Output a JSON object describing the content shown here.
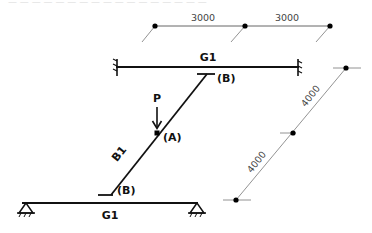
{
  "header": {
    "cropped_text": "— — — — — — — — — — — — — — — — —"
  },
  "dimensions": {
    "horizontal": [
      {
        "label": "3000"
      },
      {
        "label": "3000"
      }
    ],
    "diagonal": [
      {
        "label": "4000"
      },
      {
        "label": "4000"
      }
    ]
  },
  "members": {
    "top_girder": {
      "label": "G1",
      "support": "fixed-both-ends"
    },
    "bottom_girder": {
      "label": "G1",
      "support": "pinned-both-ends"
    },
    "diagonal_beam": {
      "label": "B1"
    }
  },
  "points": {
    "top_connection": {
      "label": "(B)"
    },
    "bottom_connection": {
      "label": "(B)"
    },
    "load_point": {
      "label": "(A)"
    }
  },
  "load": {
    "label": "P"
  },
  "colors": {
    "member": "#111111",
    "dimension": "#555555",
    "dimension_text": "#444444"
  }
}
